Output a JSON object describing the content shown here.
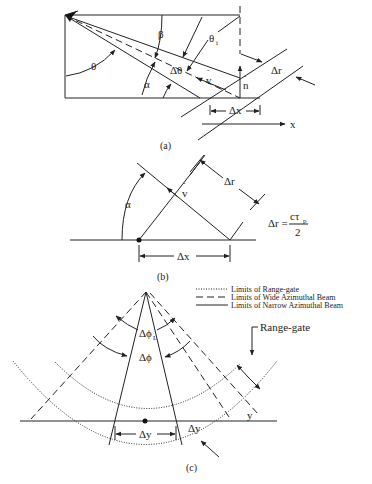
{
  "figure": {
    "panel_a": {
      "caption": "(a)",
      "labels": {
        "theta": "θ",
        "beta": "β",
        "theta_i": "θ",
        "theta_i_sub": "i",
        "delta_theta": "Δθ",
        "alpha": "α",
        "v_hat": "v",
        "n_hat": "n",
        "delta_r": "Δr",
        "delta_x": "Δx",
        "x_axis": "x"
      }
    },
    "panel_b": {
      "caption": "(b)",
      "labels": {
        "alpha": "α",
        "v_hat": "v",
        "delta_r": "Δr",
        "delta_x": "Δx"
      },
      "equation": {
        "lhs": "Δr =",
        "numerator": "cτ",
        "numerator_sub": "p",
        "denominator": "2"
      }
    },
    "panel_c": {
      "caption": "(c)",
      "labels": {
        "delta_phi_L": "Δϕ",
        "delta_phi_L_sub": "L",
        "delta_phi": "Δϕ",
        "delta_y": "Δy",
        "delta_y_right": "Δy",
        "y_axis": "y",
        "range_gate": "Range-gate"
      },
      "legend": [
        {
          "style": "dotted",
          "label": "Limits of Range-gate"
        },
        {
          "style": "dashed",
          "label": "Limits of Wide Azimuthal Beam"
        },
        {
          "style": "solid",
          "label": "Limits of Narrow Azimuthal Beam"
        }
      ]
    }
  }
}
